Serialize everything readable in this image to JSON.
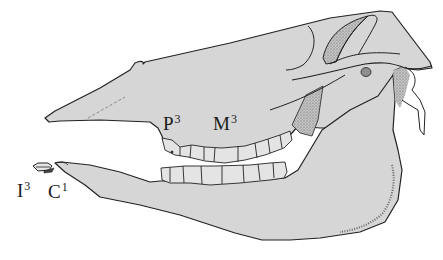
{
  "figure": {
    "colors": {
      "bone_fill": "#d6d6d6",
      "outline": "#222222",
      "stipple": "#8a8a8a",
      "background": "#ffffff"
    }
  },
  "labels": [
    {
      "id": "P3",
      "base": "P",
      "sup": "3",
      "x": 163,
      "y": 113
    },
    {
      "id": "M3",
      "base": "M",
      "sup": "3",
      "x": 213,
      "y": 113
    },
    {
      "id": "I3",
      "base": "I",
      "sup": "3",
      "x": 17,
      "y": 180
    },
    {
      "id": "C1",
      "base": "C",
      "sup": "1",
      "x": 48,
      "y": 181
    }
  ]
}
